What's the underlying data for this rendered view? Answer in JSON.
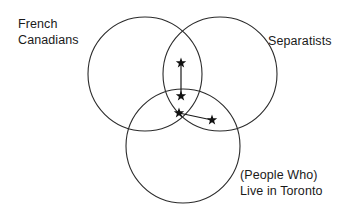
{
  "figure": {
    "type": "venn-diagram",
    "background_color": "#ffffff",
    "stroke_color": "#2b2b2b",
    "marker_color": "#111111",
    "text_color": "#1a1a1a"
  },
  "labels": {
    "french_canadians": "French\nCanadians",
    "separatists": "Separatists",
    "live_in_toronto": "(People Who)\nLive in Toronto"
  },
  "chart_data": {
    "type": "venn",
    "title": "",
    "sets": [
      {
        "name": "French Canadians",
        "cx": 145,
        "cy": 74,
        "r": 57,
        "label_position": "top-left"
      },
      {
        "name": "Separatists",
        "cx": 220,
        "cy": 74,
        "r": 57,
        "label_position": "right"
      },
      {
        "name": "(People Who) Live in Toronto",
        "cx": 183,
        "cy": 146,
        "r": 57,
        "label_position": "bottom-right"
      }
    ],
    "markers": [
      {
        "id": "star-1",
        "x": 181,
        "y": 63,
        "glyph": "star",
        "region": "French Canadians + Separatists"
      },
      {
        "id": "star-2",
        "x": 181,
        "y": 96,
        "glyph": "star",
        "region": "French Canadians + Separatists + Live in Toronto"
      },
      {
        "id": "star-3",
        "x": 179,
        "y": 113,
        "glyph": "star",
        "region": "French Canadians + Separatists + Live in Toronto"
      },
      {
        "id": "star-4",
        "x": 212,
        "y": 120,
        "glyph": "star",
        "region": "Separatists + Live in Toronto"
      }
    ],
    "connectors": [
      {
        "id": "connector-vertical",
        "from": "star-1",
        "to": "star-2",
        "x1": 181,
        "y1": 63,
        "x2": 181,
        "y2": 96
      },
      {
        "id": "connector-diagonal",
        "from": "star-3",
        "to": "star-4",
        "x1": 179,
        "y1": 113,
        "x2": 212,
        "y2": 120
      }
    ],
    "grid": false,
    "legend": "none"
  }
}
